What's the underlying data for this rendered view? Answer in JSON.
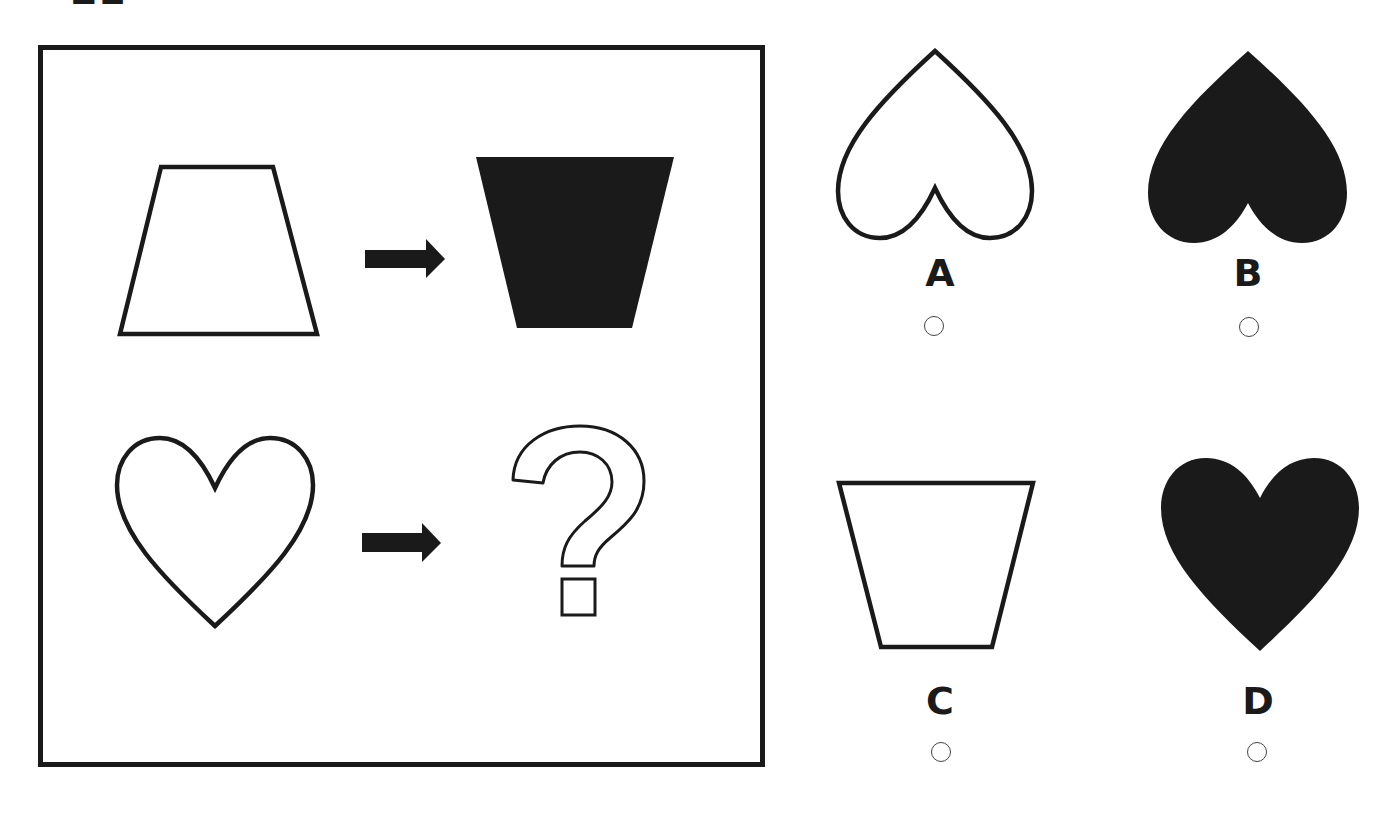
{
  "question": {
    "number_partial": "21",
    "prompt_pairs": [
      {
        "from": {
          "shape": "trapezoid",
          "orientation": "wide-bottom",
          "fill": "outline"
        },
        "arrow": "right-arrow-icon",
        "to": {
          "shape": "trapezoid",
          "orientation": "wide-top",
          "fill": "solid"
        }
      },
      {
        "from": {
          "shape": "heart",
          "orientation": "upright",
          "fill": "outline"
        },
        "arrow": "right-arrow-icon",
        "to": {
          "shape": "question-mark",
          "fill": "outline"
        }
      }
    ]
  },
  "options": [
    {
      "label": "A",
      "shape": "heart",
      "orientation": "inverted",
      "fill": "outline",
      "selected": false
    },
    {
      "label": "B",
      "shape": "heart",
      "orientation": "inverted",
      "fill": "solid",
      "selected": false
    },
    {
      "label": "C",
      "shape": "trapezoid",
      "orientation": "wide-top",
      "fill": "outline",
      "selected": false
    },
    {
      "label": "D",
      "shape": "heart",
      "orientation": "upright",
      "fill": "solid",
      "selected": false
    }
  ],
  "colors": {
    "ink": "#1a1a1a",
    "background": "#ffffff",
    "radio_border": "#444444"
  }
}
